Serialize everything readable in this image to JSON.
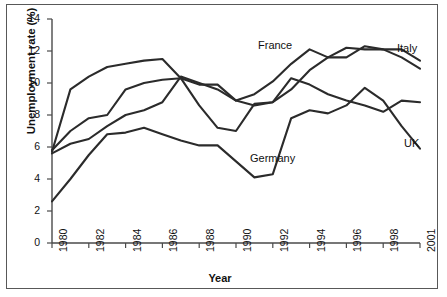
{
  "figure": {
    "background_color": "#ffffff",
    "frame_color": "#585858",
    "line_color": "#2b2b2b"
  },
  "axes": {
    "ylabel": "Unemployment rate (%)",
    "xlabel": "Year",
    "yticks": [
      "0",
      "2",
      "4",
      "6",
      "8",
      "10",
      "12",
      "14"
    ],
    "xticks": [
      "1980",
      "1982",
      "1984",
      "1986",
      "1988",
      "1990",
      "1992",
      "1994",
      "1996",
      "1998",
      "2001"
    ]
  },
  "series_labels": {
    "france": "France",
    "italy": "Italy",
    "germany": "Germany",
    "uk": "UK"
  },
  "chart_data": {
    "type": "line",
    "title": "",
    "xlabel": "Year",
    "ylabel": "Unemployment rate (%)",
    "xlim": [
      1980,
      2000
    ],
    "ylim": [
      0,
      14
    ],
    "grid": false,
    "legend": "inline-annotations",
    "xticklabels": [
      "1980",
      "1982",
      "1984",
      "1986",
      "1988",
      "1990",
      "1992",
      "1994",
      "1996",
      "1998",
      "2001"
    ],
    "yticklabels": [
      "0",
      "2",
      "4",
      "6",
      "8",
      "10",
      "12",
      "14"
    ],
    "x": [
      1980,
      1981,
      1982,
      1983,
      1984,
      1985,
      1986,
      1987,
      1988,
      1989,
      1990,
      1991,
      1992,
      1993,
      1994,
      1995,
      1996,
      1997,
      1998,
      1999,
      2000
    ],
    "series": [
      {
        "name": "France",
        "label_text": "France",
        "values": [
          5.8,
          7.0,
          7.8,
          8.0,
          9.6,
          10.0,
          10.2,
          10.3,
          9.9,
          9.9,
          8.9,
          9.3,
          10.1,
          11.2,
          12.1,
          11.6,
          12.2,
          12.1,
          12.1,
          11.6,
          10.9
        ]
      },
      {
        "name": "Italy",
        "label_text": "Italy",
        "values": [
          5.6,
          6.2,
          6.5,
          7.3,
          8.0,
          8.3,
          8.8,
          10.4,
          10.0,
          9.6,
          8.9,
          8.6,
          8.8,
          9.6,
          10.8,
          11.6,
          11.6,
          12.3,
          12.1,
          12.1,
          11.4
        ]
      },
      {
        "name": "Germany",
        "label_text": "Germany",
        "values": [
          5.7,
          9.6,
          10.4,
          11.0,
          11.2,
          11.4,
          11.5,
          10.3,
          8.6,
          7.2,
          7.0,
          8.7,
          8.8,
          10.3,
          9.9,
          9.3,
          8.9,
          8.6,
          8.2,
          8.9,
          8.8
        ]
      },
      {
        "name": "UK",
        "label_text": "UK",
        "values": [
          2.6,
          4.0,
          5.5,
          6.8,
          6.9,
          7.2,
          6.8,
          6.4,
          6.1,
          6.1,
          5.1,
          4.1,
          4.3,
          7.8,
          8.3,
          8.1,
          8.6,
          9.7,
          8.9,
          7.3,
          5.9
        ]
      }
    ]
  }
}
